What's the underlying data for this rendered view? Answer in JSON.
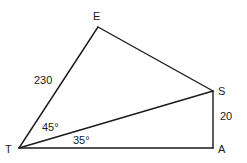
{
  "diagram": {
    "type": "geometry",
    "vertices": {
      "T": {
        "label": "T"
      },
      "E": {
        "label": "E"
      },
      "S": {
        "label": "S"
      },
      "A": {
        "label": "A"
      }
    },
    "measurements": {
      "TE_length": "230",
      "SA_length": "20",
      "angle_ETS": "45°",
      "angle_STA": "35°"
    },
    "edges": [
      "TE",
      "ES",
      "TS",
      "TA",
      "SA"
    ]
  }
}
